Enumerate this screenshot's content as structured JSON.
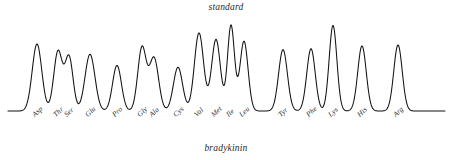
{
  "chart_data": {
    "type": "line",
    "title": "standard",
    "caption": "bradykinin",
    "xlabel": "",
    "ylabel": "",
    "grid": false,
    "legend": "none",
    "baseline_color": "#111111",
    "trace_color": "#111111",
    "ylim": [
      0,
      100
    ],
    "x_axis_units": "elution position (px)",
    "categories": [
      "Asp",
      "Thr",
      "Ser",
      "Glu",
      "Pro",
      "Gly",
      "Ala",
      "Cys",
      "Val",
      "Met",
      "Ile",
      "Leu",
      "Tyr",
      "Phe",
      "Lys",
      "His",
      "Arg"
    ],
    "peaks": [
      {
        "label": "Asp",
        "x": 37,
        "height": 72,
        "width": 5.2
      },
      {
        "label": "Thr",
        "x": 58,
        "height": 64,
        "width": 4.6
      },
      {
        "label": "Ser",
        "x": 69,
        "height": 58,
        "width": 4.4
      },
      {
        "label": "Glu",
        "x": 90,
        "height": 61,
        "width": 5.4
      },
      {
        "label": "Pro",
        "x": 117,
        "height": 49,
        "width": 4.8
      },
      {
        "label": "Gly",
        "x": 142,
        "height": 68,
        "width": 4.6
      },
      {
        "label": "Ala",
        "x": 154,
        "height": 57,
        "width": 5.0
      },
      {
        "label": "Cys",
        "x": 178,
        "height": 47,
        "width": 5.0
      },
      {
        "label": "Val",
        "x": 199,
        "height": 84,
        "width": 5.0
      },
      {
        "label": "Met",
        "x": 216,
        "height": 77,
        "width": 4.8
      },
      {
        "label": "Ile",
        "x": 231,
        "height": 92,
        "width": 3.8
      },
      {
        "label": "Leu",
        "x": 244,
        "height": 75,
        "width": 4.4
      },
      {
        "label": "Tyr",
        "x": 283,
        "height": 66,
        "width": 4.8
      },
      {
        "label": "Phe",
        "x": 311,
        "height": 67,
        "width": 4.6
      },
      {
        "label": "Lys",
        "x": 333,
        "height": 92,
        "width": 4.2
      },
      {
        "label": "His",
        "x": 362,
        "height": 70,
        "width": 4.6
      },
      {
        "label": "Arg",
        "x": 398,
        "height": 71,
        "width": 4.6
      }
    ],
    "baseline": {
      "x_start": 8,
      "x_end": 445,
      "y_level": 0
    }
  }
}
